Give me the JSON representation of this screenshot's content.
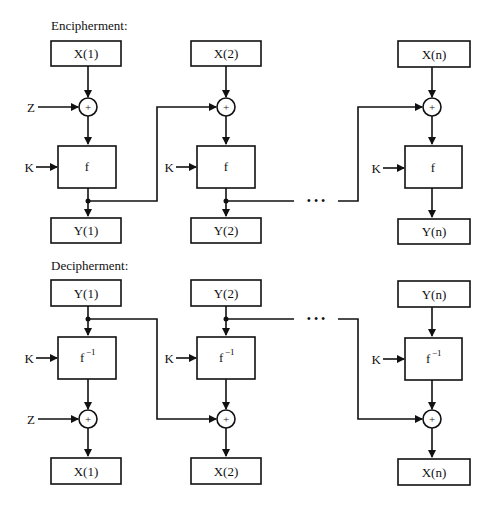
{
  "encipherment": {
    "title": "Encipherment:",
    "columns": [
      {
        "input": "X(1)",
        "func": "f",
        "key": "K",
        "output": "Y(1)",
        "side_input": "Z"
      },
      {
        "input": "X(2)",
        "func": "f",
        "key": "K",
        "output": "Y(2)"
      },
      {
        "input": "X(n)",
        "func": "f",
        "key": "K",
        "output": "Y(n)"
      }
    ],
    "ellipsis": "• • •"
  },
  "decipherment": {
    "title": "Decipherment:",
    "columns": [
      {
        "input": "Y(1)",
        "func": "f",
        "func_sup": "−1",
        "key": "K",
        "output": "X(1)",
        "side_input": "Z"
      },
      {
        "input": "Y(2)",
        "func": "f",
        "func_sup": "−1",
        "key": "K",
        "output": "X(2)"
      },
      {
        "input": "Y(n)",
        "func": "f",
        "func_sup": "−1",
        "key": "K",
        "output": "X(n)"
      }
    ],
    "ellipsis": "• • •"
  },
  "symbols": {
    "xor": "+"
  },
  "colors": {
    "line": "#111111",
    "background": "#ffffff"
  }
}
